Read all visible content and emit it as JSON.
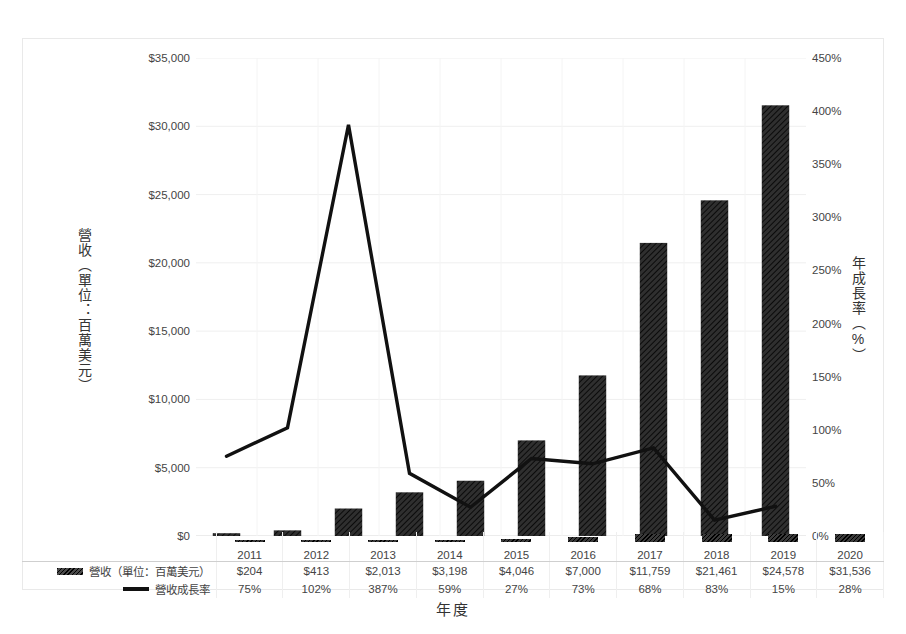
{
  "chart_data": {
    "type": "bar",
    "title": "圖 台積電歷年營收與年成長率",
    "xlabel": "年度",
    "categories": [
      "2011",
      "2012",
      "2013",
      "2014",
      "2015",
      "2016",
      "2017",
      "2018",
      "2019",
      "2020"
    ],
    "series": [
      {
        "name": "營收（單位：百萬美元）",
        "type": "bar",
        "axis": "left",
        "values": [
          204,
          413,
          2013,
          3198,
          4046,
          7000,
          11759,
          21461,
          24578,
          31536
        ],
        "labels": [
          "$204",
          "$413",
          "$2,013",
          "$3,198",
          "$4,046",
          "$7,000",
          "$11,759",
          "$21,461",
          "$24,578",
          "$31,536"
        ]
      },
      {
        "name": "營收成長率",
        "type": "line",
        "axis": "right",
        "values": [
          75,
          102,
          387,
          59,
          27,
          73,
          68,
          83,
          15,
          28
        ],
        "labels": [
          "75%",
          "102%",
          "387%",
          "59%",
          "27%",
          "73%",
          "68%",
          "83%",
          "15%",
          "28%"
        ]
      }
    ],
    "left_axis": {
      "label": "營收（單位：百萬美元）",
      "min": 0,
      "max": 35000,
      "step": 5000,
      "ticks": [
        "$0",
        "$5,000",
        "$10,000",
        "$15,000",
        "$20,000",
        "$25,000",
        "$30,000",
        "$35,000"
      ],
      "tick_values": [
        0,
        5000,
        10000,
        15000,
        20000,
        25000,
        30000,
        35000
      ]
    },
    "right_axis": {
      "label": "年成長率（%）",
      "min": 0,
      "max": 450,
      "step": 50,
      "ticks": [
        "0%",
        "50%",
        "100%",
        "150%",
        "200%",
        "250%",
        "300%",
        "350%",
        "400%",
        "450%"
      ],
      "tick_values": [
        0,
        50,
        100,
        150,
        200,
        250,
        300,
        350,
        400,
        450
      ]
    },
    "grid": true,
    "legend_position": "bottom-table",
    "colors": {
      "bar": "#2b2b2b",
      "line": "#111111",
      "grid": "#efefef",
      "frame": "#e9e9e9",
      "text": "#3a3a3a"
    }
  },
  "table": {
    "row_labels": {
      "revenue": "營收（單位：百萬美元）",
      "growth": "營收成長率"
    }
  }
}
